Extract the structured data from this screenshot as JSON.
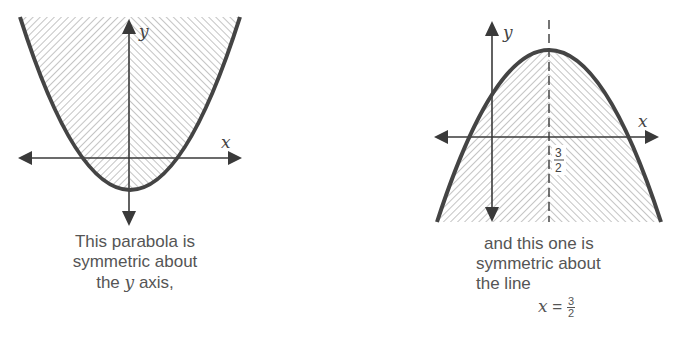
{
  "figures": [
    {
      "id": "left",
      "type": "upward parabola",
      "axis_labels": {
        "x": "x",
        "y": "y"
      },
      "symmetry": "y axis",
      "caption": {
        "line1": "This parabola is",
        "line2": "symmetric about",
        "line3_pre": "the",
        "line3_var": "y",
        "line3_post": "axis,"
      }
    },
    {
      "id": "right",
      "type": "downward parabola",
      "axis_labels": {
        "x": "x",
        "y": "y"
      },
      "tick": {
        "numerator": "3",
        "denominator": "2"
      },
      "symmetry": "x = 3/2",
      "caption": {
        "line1": "and this one is",
        "line2": "symmetric about",
        "line3": "the line",
        "eq_var": "x",
        "eq_sign": "=",
        "eq_num": "3",
        "eq_den": "2"
      }
    }
  ],
  "colors": {
    "curve": "#444444",
    "axis": "#3a3a3a",
    "hatch": "#b8b8b8",
    "text": "#555555"
  }
}
